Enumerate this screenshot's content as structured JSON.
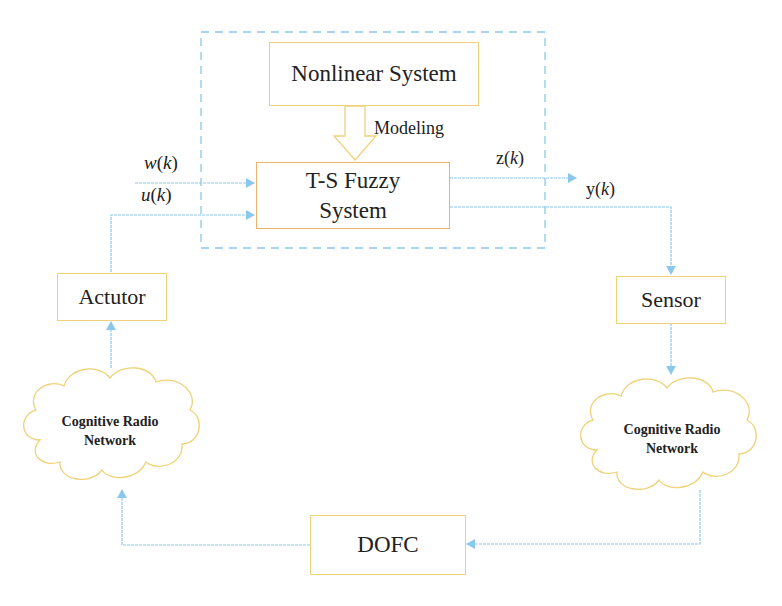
{
  "diagram": {
    "blocks": {
      "nonlinear_system": "Nonlinear System",
      "ts_fuzzy_line1": "T-S Fuzzy",
      "ts_fuzzy_line2": "System",
      "actuator": "Actutor",
      "sensor": "Sensor",
      "dofc": "DOFC",
      "cloud_left_line1": "Cognitive Radio",
      "cloud_left_line2": "Network",
      "cloud_right_line1": "Cognitive Radio",
      "cloud_right_line2": "Network"
    },
    "labels": {
      "modeling": "Modeling",
      "w_fn": "w",
      "w_arg": "k",
      "u_fn": "u",
      "u_arg": "k",
      "z_fn": "z",
      "z_arg": "k",
      "y_fn": "y",
      "y_arg": "k"
    },
    "colors": {
      "arrow": "#8cc8ee",
      "box_border": "#efd27a",
      "ts_border": "#efb26a",
      "dashed_boundary": "#8cc8ee"
    }
  }
}
